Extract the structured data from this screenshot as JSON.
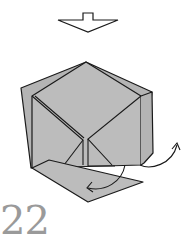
{
  "diagram": {
    "type": "origami-step",
    "step_number": "22",
    "symbols": [
      {
        "name": "turn-over-arrow",
        "meaning": "hollow arrow pointing down (result view)"
      },
      {
        "name": "fold-arrow-left",
        "meaning": "curved arrow folding bottom flap to the left"
      },
      {
        "name": "fold-arrow-right",
        "meaning": "curved arrow opening right flap upward"
      }
    ],
    "colors": {
      "paper": "#bcbcbc",
      "paper_back": "#b4b4b4",
      "line": "#1a1a1a",
      "step_number": "#9a9a9a",
      "background": "#ffffff"
    }
  }
}
